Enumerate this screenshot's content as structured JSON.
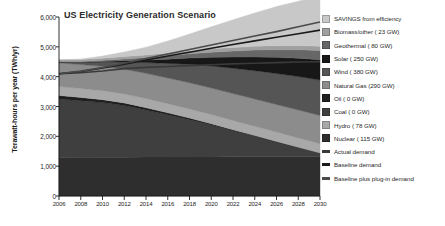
{
  "chart_data": {
    "type": "area",
    "title": "US Electricity Generation Scenario",
    "xlabel": "",
    "ylabel": "Terawatt-hours per year (TWh/yr)",
    "xlim": [
      2006,
      2030
    ],
    "ylim": [
      0,
      6000
    ],
    "grid": false,
    "legend_position": "right",
    "x": [
      2006,
      2008,
      2010,
      2012,
      2014,
      2016,
      2018,
      2020,
      2022,
      2024,
      2026,
      2028,
      2030
    ],
    "xticklabels": [
      "2006",
      "2008",
      "2010",
      "2012",
      "2014",
      "2016",
      "2018",
      "2020",
      "2022",
      "2024",
      "2026",
      "2028",
      "2030"
    ],
    "yticklabels": [
      "0",
      "1,000",
      "2,000",
      "3,000",
      "4,000",
      "5,000",
      "6,000"
    ],
    "yticks": [
      0,
      1000,
      2000,
      3000,
      4000,
      5000,
      6000
    ],
    "stacking": "stacked-area-bottom-to-top",
    "series": [
      {
        "name": "Nuclear ( 115 GW)",
        "color": "#2e2e2e",
        "values": [
          1290,
          1295,
          1300,
          1300,
          1305,
          1305,
          1310,
          1310,
          1312,
          1315,
          1315,
          1318,
          1320
        ]
      },
      {
        "name": "Coal ( 0 GW)",
        "color": "#3f3f3f",
        "values": [
          1960,
          1900,
          1830,
          1730,
          1580,
          1420,
          1250,
          1070,
          880,
          690,
          500,
          310,
          120
        ]
      },
      {
        "name": "Oil ( 0 GW)",
        "color": "#1f1f1f",
        "values": [
          120,
          110,
          100,
          88,
          76,
          64,
          52,
          42,
          32,
          24,
          16,
          8,
          0
        ]
      },
      {
        "name": "Hydro ( 78 GW)",
        "color": "#a8a8a8",
        "values": [
          300,
          300,
          302,
          303,
          305,
          306,
          307,
          308,
          309,
          310,
          311,
          312,
          313
        ]
      },
      {
        "name": "Natural Gas (290 GW)",
        "color": "#8c8c8c",
        "values": [
          790,
          800,
          815,
          830,
          845,
          860,
          875,
          890,
          900,
          912,
          925,
          935,
          945
        ]
      },
      {
        "name": "Wind ( 380 GW)",
        "color": "#555555",
        "values": [
          30,
          70,
          140,
          240,
          360,
          490,
          620,
          740,
          850,
          950,
          1040,
          1120,
          1190
        ]
      },
      {
        "name": "Solar ( 250 GW)",
        "color": "#171717",
        "values": [
          2,
          8,
          20,
          45,
          85,
          140,
          210,
          290,
          375,
          460,
          540,
          615,
          680
        ]
      },
      {
        "name": "Geothermal ( 80 GW)",
        "color": "#676767",
        "values": [
          15,
          25,
          40,
          60,
          85,
          112,
          140,
          170,
          200,
          230,
          258,
          285,
          310
        ]
      },
      {
        "name": "Biomass/other ( 23 GW)",
        "color": "#9f9f9f",
        "values": [
          60,
          65,
          72,
          80,
          88,
          96,
          104,
          112,
          120,
          127,
          133,
          139,
          145
        ]
      },
      {
        "name": "SAVINGS from efficiency",
        "color": "#c8c8c8",
        "values": [
          0,
          20,
          70,
          150,
          260,
          400,
          560,
          740,
          930,
          1120,
          1310,
          1490,
          1660
        ]
      }
    ],
    "lines": [
      {
        "name": "Actual demand",
        "color": "#3a3a3a",
        "values": [
          4100,
          4130,
          4190,
          4270,
          4310,
          4340,
          4370,
          4400,
          4430,
          4450,
          4470,
          4490,
          4500
        ]
      },
      {
        "name": "Baseline demand",
        "color": "#1a1a1a",
        "values": [
          4100,
          4175,
          4290,
          4420,
          4560,
          4690,
          4820,
          4950,
          5080,
          5200,
          5320,
          5440,
          5560
        ]
      },
      {
        "name": "Baseline plus plug-in demand",
        "color": "#4a4a4a",
        "values": [
          4100,
          4185,
          4310,
          4450,
          4610,
          4760,
          4910,
          5060,
          5210,
          5360,
          5510,
          5670,
          5830
        ]
      }
    ]
  },
  "legend": {
    "items": [
      {
        "label": "SAVINGS from efficiency",
        "color": "#c8c8c8",
        "type": "swatch"
      },
      {
        "label": "Biomass/other ( 23 GW)",
        "color": "#9f9f9f",
        "type": "swatch"
      },
      {
        "label": "Geothermal ( 80 GW)",
        "color": "#676767",
        "type": "swatch"
      },
      {
        "label": "Solar ( 250 GW)",
        "color": "#171717",
        "type": "swatch"
      },
      {
        "label": "Wind ( 380 GW)",
        "color": "#555555",
        "type": "swatch"
      },
      {
        "label": "Natural Gas (290 GW)",
        "color": "#8c8c8c",
        "type": "swatch"
      },
      {
        "label": "Oil ( 0 GW)",
        "color": "#1f1f1f",
        "type": "swatch"
      },
      {
        "label": "Coal ( 0 GW)",
        "color": "#3f3f3f",
        "type": "swatch"
      },
      {
        "label": "Hydro ( 78 GW)",
        "color": "#a8a8a8",
        "type": "swatch"
      },
      {
        "label": "Nuclear ( 115 GW)",
        "color": "#2e2e2e",
        "type": "swatch"
      },
      {
        "label": "Actual demand",
        "color": "#3a3a3a",
        "type": "line"
      },
      {
        "label": "Baseline demand",
        "color": "#1a1a1a",
        "type": "line"
      },
      {
        "label": "Baseline plus plug-in demand",
        "color": "#4a4a4a",
        "type": "line"
      }
    ]
  }
}
